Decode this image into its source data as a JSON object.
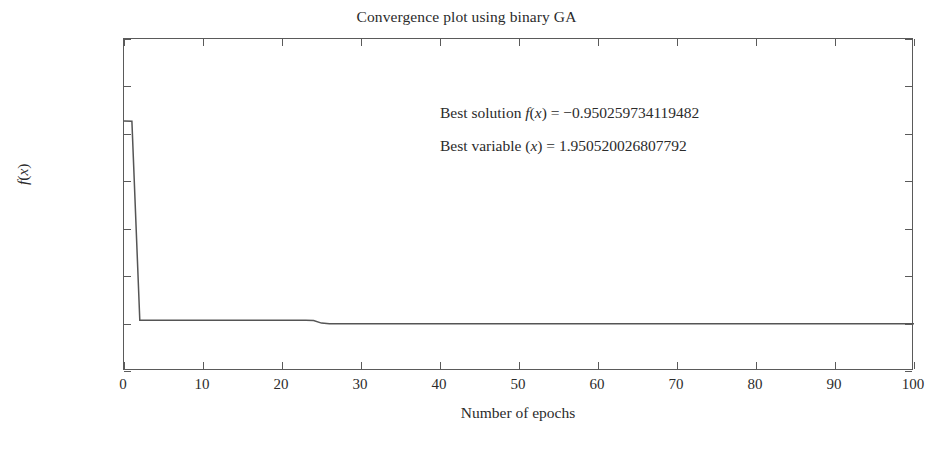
{
  "chart_data": {
    "type": "line",
    "title": "Convergence plot using binary GA",
    "xlabel": "Number of epochs",
    "ylabel": "f(x)",
    "xlim": [
      0,
      100
    ],
    "ylim": [
      -1,
      -0.65
    ],
    "grid": false,
    "legend": null,
    "x_ticks": [
      0,
      10,
      20,
      30,
      40,
      50,
      60,
      70,
      80,
      90,
      100
    ],
    "x_tick_labels": [
      "0",
      "10",
      "20",
      "30",
      "40",
      "50",
      "60",
      "70",
      "80",
      "90",
      "100"
    ],
    "y_ticks": [
      -0.65,
      -0.7,
      -0.75,
      -0.8,
      -0.85,
      -0.9,
      -0.95,
      -1
    ],
    "y_tick_labels": [
      "−0.65",
      "−0.7",
      "−0.75",
      "−0.8",
      "−0.85",
      "−0.9",
      "−0.95",
      "−1"
    ],
    "line_color": "#555555",
    "series": [
      {
        "name": "best fitness per epoch",
        "x": [
          0,
          1,
          2,
          3,
          4,
          5,
          10,
          15,
          20,
          23,
          24,
          25,
          26,
          30,
          40,
          50,
          60,
          70,
          80,
          90,
          100
        ],
        "values": [
          -0.7365,
          -0.7368,
          -0.9465,
          -0.9465,
          -0.9465,
          -0.9465,
          -0.9465,
          -0.9465,
          -0.9465,
          -0.9465,
          -0.9468,
          -0.9495,
          -0.95026,
          -0.95026,
          -0.95026,
          -0.95026,
          -0.95026,
          -0.95026,
          -0.95026,
          -0.95026,
          -0.95026
        ]
      }
    ],
    "annotations": [
      {
        "id": "best-solution",
        "parts": [
          {
            "text": "Best solution ",
            "style": "normal"
          },
          {
            "text": "f",
            "style": "italic"
          },
          {
            "text": "(",
            "style": "normal"
          },
          {
            "text": "x",
            "style": "italic"
          },
          {
            "text": ") = −0.950259734119482",
            "style": "normal"
          }
        ],
        "text": "Best solution f(x) = −0.950259734119482",
        "value": -0.950259734119482
      },
      {
        "id": "best-variable",
        "parts": [
          {
            "text": "Best variable (",
            "style": "normal"
          },
          {
            "text": "x",
            "style": "italic"
          },
          {
            "text": ") = 1.950520026807792",
            "style": "normal"
          }
        ],
        "text": "Best variable (x) = 1.950520026807792",
        "value": 1.950520026807792
      }
    ]
  },
  "figure": {
    "background": "#ffffff",
    "axis_color": "#5a5a5a",
    "text_color": "#2b2b2b"
  }
}
